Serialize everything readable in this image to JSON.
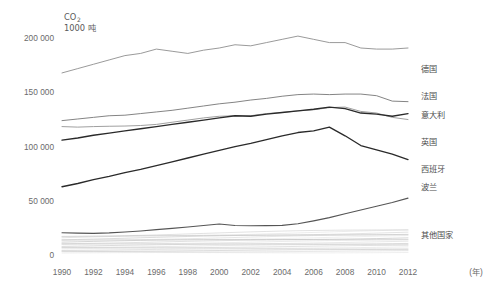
{
  "chart_data": {
    "type": "line",
    "title": "",
    "subtitle": "",
    "unit_label_line1": "CO",
    "unit_label_sub": "2",
    "unit_label_line2": "1000 吨",
    "xlabel": "(年)",
    "ylabel": "",
    "x": [
      1990,
      1991,
      1992,
      1993,
      1994,
      1995,
      1996,
      1997,
      1998,
      1999,
      2000,
      2001,
      2002,
      2003,
      2004,
      2005,
      2006,
      2007,
      2008,
      2009,
      2010,
      2011,
      2012
    ],
    "xticks": [
      "1990",
      "1992",
      "1994",
      "1996",
      "1998",
      "2000",
      "2002",
      "2004",
      "2006",
      "2008",
      "2010",
      "2012"
    ],
    "xtick_values": [
      1990,
      1992,
      1994,
      1996,
      1998,
      2000,
      2002,
      2004,
      2006,
      2008,
      2010,
      2012
    ],
    "yticks": [
      "0",
      "50 000",
      "100 000",
      "150 000",
      "200 000"
    ],
    "ytick_values": [
      0,
      50000,
      100000,
      150000,
      200000
    ],
    "ylim": [
      0,
      215000
    ],
    "xlim": [
      1990,
      2012
    ],
    "grid": false,
    "legend_position": "right",
    "series": [
      {
        "name": "德国",
        "color": "#8e8e8e",
        "width": 0.9,
        "legend_y": 72,
        "values": [
          168000,
          172000,
          176000,
          180000,
          184000,
          186000,
          190000,
          188000,
          186000,
          189000,
          191000,
          194000,
          193000,
          196000,
          199000,
          202000,
          199000,
          196000,
          196000,
          191000,
          190000,
          190000,
          191000
        ]
      },
      {
        "name": "法国",
        "color": "#767676",
        "width": 0.9,
        "legend_y": 99,
        "values": [
          124000,
          125500,
          127000,
          128500,
          129000,
          130500,
          132000,
          133500,
          135500,
          137500,
          139500,
          141000,
          143000,
          144500,
          146500,
          148000,
          148500,
          148000,
          148500,
          148500,
          147000,
          142000,
          141500
        ]
      },
      {
        "name": "意大利",
        "color": "#a0a0a0",
        "width": 1.0,
        "legend_y": 118,
        "values": [
          118500,
          118000,
          118500,
          118800,
          119000,
          119500,
          120500,
          122500,
          124500,
          126500,
          128000,
          128500,
          128500,
          130500,
          131500,
          133000,
          134000,
          136000,
          136500,
          132500,
          131000,
          127000,
          125000
        ]
      },
      {
        "name": "英国",
        "color": "#2a2a2a",
        "width": 1.35,
        "legend_y": 145,
        "values": [
          106000,
          108000,
          110500,
          112500,
          114500,
          116500,
          118500,
          120500,
          122500,
          124500,
          126500,
          128500,
          128000,
          130000,
          131500,
          133000,
          134500,
          136500,
          135000,
          131000,
          130000,
          128000,
          130500
        ]
      },
      {
        "name": "西班牙",
        "color": "#2a2a2a",
        "width": 1.35,
        "legend_y": 172,
        "values": [
          63000,
          66000,
          69500,
          72500,
          76000,
          79000,
          82500,
          86000,
          89500,
          93000,
          96500,
          100000,
          103000,
          106500,
          110000,
          113000,
          114500,
          118000,
          110000,
          101000,
          97000,
          93000,
          88000
        ]
      },
      {
        "name": "波兰",
        "color": "#555555",
        "width": 1.1,
        "legend_y": 190,
        "values": [
          20500,
          20200,
          20000,
          20400,
          21200,
          22200,
          23400,
          24600,
          25800,
          27200,
          28600,
          27200,
          27000,
          27100,
          27300,
          28800,
          31500,
          34500,
          38000,
          41500,
          45000,
          48500,
          52500
        ]
      }
    ],
    "other_group": {
      "name": "其他国家",
      "color": "#b9b9b9",
      "legend_y": 238,
      "line_count": 18,
      "start_range": [
        1800,
        17500
      ],
      "end_range": [
        2400,
        23500
      ]
    }
  },
  "plot": {
    "left": 62,
    "right": 408,
    "top": 22,
    "bottom": 255
  }
}
